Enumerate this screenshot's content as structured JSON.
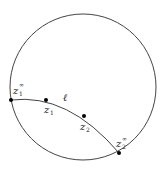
{
  "diagram": {
    "colors": {
      "stroke": "#444444",
      "point": "#000000",
      "background": "#ffffff"
    },
    "circle": {
      "cx": 83,
      "cy": 87,
      "r": 73
    },
    "geodesic": {
      "label": "ℓ",
      "path": "M 11 100 Q 68 93 119 153"
    },
    "points": [
      {
        "id": "z1_inf",
        "base": "z",
        "sub": "1",
        "sup": "∞",
        "x": 11,
        "y": 100
      },
      {
        "id": "z1",
        "base": "z",
        "sub": "1",
        "sup": "",
        "x": 46,
        "y": 100
      },
      {
        "id": "z2",
        "base": "z",
        "sub": "2",
        "sup": "",
        "x": 84,
        "y": 116
      },
      {
        "id": "z2_inf",
        "base": "z",
        "sub": "2",
        "sup": "∞",
        "x": 119,
        "y": 153
      }
    ],
    "labels": {
      "ell": "ℓ",
      "z1_inf": {
        "base": "z",
        "sub": "1",
        "sup": "∞"
      },
      "z1": {
        "base": "z",
        "sub": "1"
      },
      "z2": {
        "base": "z",
        "sub": "2"
      },
      "z2_inf": {
        "base": "z",
        "sub": "2",
        "sup": "∞"
      }
    }
  }
}
